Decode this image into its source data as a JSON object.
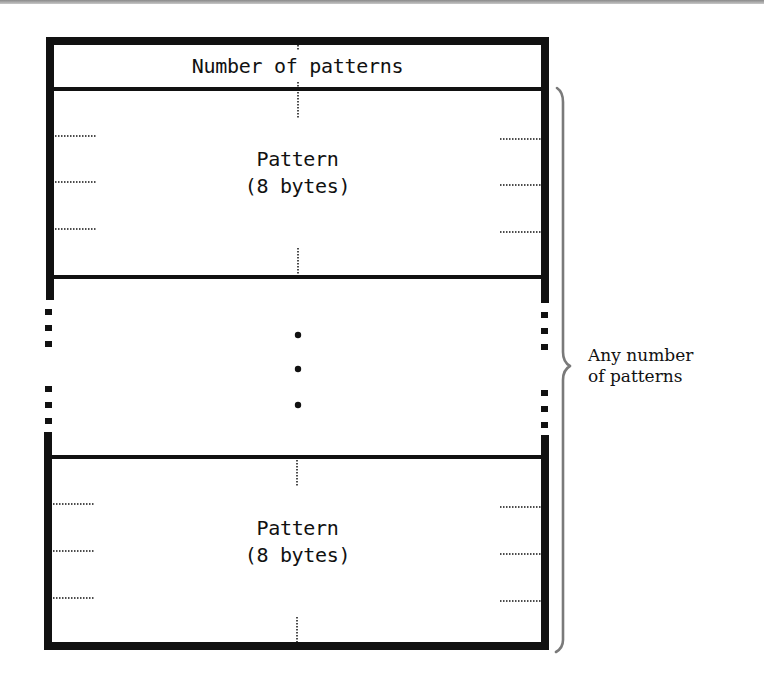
{
  "diagram": {
    "type": "memory-layout",
    "header": {
      "label": "Number of patterns"
    },
    "records": [
      {
        "line1": "Pattern",
        "line2": "(8 bytes)"
      },
      {
        "elided": true,
        "marker": "vertical-ellipsis"
      },
      {
        "line1": "Pattern",
        "line2": "(8 bytes)"
      }
    ],
    "brace": {
      "line1": "Any number",
      "line2": "of patterns",
      "color": "#7a7a7a"
    },
    "colors": {
      "border": "#111111",
      "background": "#ffffff",
      "scan_strip": "#9a9a9a"
    }
  }
}
